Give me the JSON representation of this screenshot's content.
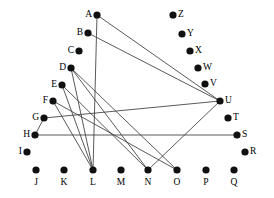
{
  "figure": {
    "background_color": "#ffffff",
    "node_color": "#101010",
    "edge_color": "#3c3c3c",
    "label_color": "#000000",
    "node_radius": 3.6,
    "edge_width": 0.85,
    "width": 274,
    "height": 198
  },
  "chart_data": {
    "type": "scatter",
    "title": "",
    "xlabel": "",
    "ylabel": "",
    "grid": false,
    "legend": "none",
    "xlim": [
      0,
      274
    ],
    "ylim": [
      0,
      198
    ],
    "nodes": [
      {
        "id": "A",
        "x": 97,
        "y": 15,
        "label": "A",
        "label_side": "left"
      },
      {
        "id": "B",
        "x": 88,
        "y": 33,
        "label": "B",
        "label_side": "left"
      },
      {
        "id": "C",
        "x": 79,
        "y": 51,
        "label": "C",
        "label_side": "left"
      },
      {
        "id": "D",
        "x": 71,
        "y": 68,
        "label": "D",
        "label_side": "left"
      },
      {
        "id": "E",
        "x": 62,
        "y": 85,
        "label": "E",
        "label_side": "left"
      },
      {
        "id": "F",
        "x": 53,
        "y": 101,
        "label": "F",
        "label_side": "left"
      },
      {
        "id": "G",
        "x": 44,
        "y": 118,
        "label": "G",
        "label_side": "left"
      },
      {
        "id": "H",
        "x": 35,
        "y": 135,
        "label": "H",
        "label_side": "left"
      },
      {
        "id": "I",
        "x": 27,
        "y": 152,
        "label": "I",
        "label_side": "left"
      },
      {
        "id": "J",
        "x": 36,
        "y": 170,
        "label": "J",
        "label_side": "below"
      },
      {
        "id": "K",
        "x": 64,
        "y": 170,
        "label": "K",
        "label_side": "below"
      },
      {
        "id": "L",
        "x": 93,
        "y": 170,
        "label": "L",
        "label_side": "below"
      },
      {
        "id": "M",
        "x": 121,
        "y": 170,
        "label": "M",
        "label_side": "below"
      },
      {
        "id": "N",
        "x": 148,
        "y": 170,
        "label": "N",
        "label_side": "below"
      },
      {
        "id": "O",
        "x": 177,
        "y": 170,
        "label": "O",
        "label_side": "below"
      },
      {
        "id": "P",
        "x": 206,
        "y": 170,
        "label": "P",
        "label_side": "below"
      },
      {
        "id": "Q",
        "x": 234,
        "y": 170,
        "label": "Q",
        "label_side": "below"
      },
      {
        "id": "R",
        "x": 245,
        "y": 152,
        "label": "R",
        "label_side": "right"
      },
      {
        "id": "S",
        "x": 237,
        "y": 135,
        "label": "S",
        "label_side": "right"
      },
      {
        "id": "T",
        "x": 228,
        "y": 118,
        "label": "T",
        "label_side": "right"
      },
      {
        "id": "U",
        "x": 220,
        "y": 101,
        "label": "U",
        "label_side": "right"
      },
      {
        "id": "V",
        "x": 205,
        "y": 84,
        "label": "V",
        "label_side": "right"
      },
      {
        "id": "W",
        "x": 198,
        "y": 68,
        "label": "W",
        "label_side": "right"
      },
      {
        "id": "X",
        "x": 190,
        "y": 51,
        "label": "X",
        "label_side": "right"
      },
      {
        "id": "Y",
        "x": 182,
        "y": 34,
        "label": "Y",
        "label_side": "right"
      },
      {
        "id": "Z",
        "x": 173,
        "y": 15,
        "label": "Z",
        "label_side": "right"
      }
    ],
    "edges": [
      {
        "source": "A",
        "target": "L"
      },
      {
        "source": "A",
        "target": "U"
      },
      {
        "source": "B",
        "target": "U"
      },
      {
        "source": "D",
        "target": "L"
      },
      {
        "source": "D",
        "target": "N"
      },
      {
        "source": "D",
        "target": "O"
      },
      {
        "source": "E",
        "target": "L"
      },
      {
        "source": "E",
        "target": "N"
      },
      {
        "source": "F",
        "target": "L"
      },
      {
        "source": "F",
        "target": "O"
      },
      {
        "source": "G",
        "target": "U"
      },
      {
        "source": "G",
        "target": "H"
      },
      {
        "source": "H",
        "target": "S"
      },
      {
        "source": "N",
        "target": "U"
      }
    ],
    "node_count": 26,
    "edge_count": 14
  }
}
